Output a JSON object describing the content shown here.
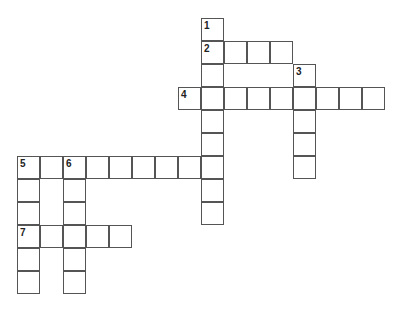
{
  "puzzle": {
    "origin_x": 17,
    "origin_y": 18,
    "cell_size": 23.4,
    "border_color": "#555555",
    "words": [
      {
        "number": "1",
        "direction": "down",
        "col": 8,
        "row": 0,
        "length": 9
      },
      {
        "number": "2",
        "direction": "across",
        "col": 8,
        "row": 1,
        "length": 4
      },
      {
        "number": "3",
        "direction": "down",
        "col": 12,
        "row": 2,
        "length": 5
      },
      {
        "number": "4",
        "direction": "across",
        "col": 7,
        "row": 3,
        "length": 9
      },
      {
        "number": "5",
        "direction": "across",
        "col": 0,
        "row": 6,
        "length": 9
      },
      {
        "number": "5",
        "direction": "down",
        "col": 0,
        "row": 6,
        "length": 6
      },
      {
        "number": "6",
        "direction": "down",
        "col": 2,
        "row": 6,
        "length": 6
      },
      {
        "number": "7",
        "direction": "across",
        "col": 0,
        "row": 9,
        "length": 5
      }
    ]
  }
}
